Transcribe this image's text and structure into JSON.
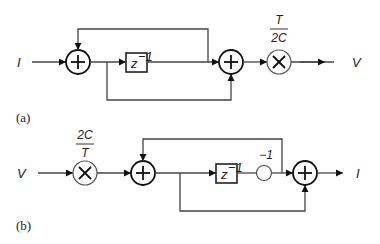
{
  "diagram_a": {
    "caption": "(a)",
    "input_label": "I",
    "output_label": "V",
    "delay_label": "z",
    "delay_exp": "−1",
    "gain_num": "T",
    "gain_den": "2C"
  },
  "diagram_b": {
    "caption": "(b)",
    "input_label": "V",
    "output_label": "I",
    "delay_label": "z",
    "delay_exp": "−1",
    "gain_num": "2C",
    "gain_den": "T",
    "invert_label": "−1"
  }
}
